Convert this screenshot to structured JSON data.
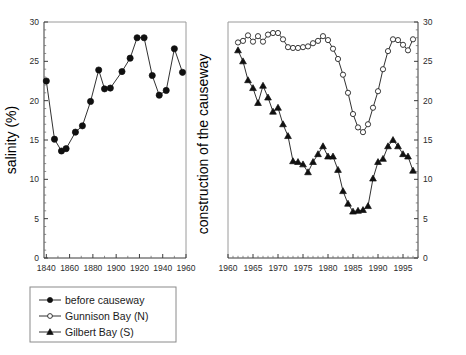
{
  "figure": {
    "title": "",
    "background_color": "#ffffff",
    "ink_color": "#1a1a1a"
  },
  "left_panel": {
    "ylabel": "salinity (%)",
    "xlim": [
      1838,
      1960
    ],
    "ylim": [
      0,
      30
    ],
    "yticks": [
      0,
      5,
      10,
      15,
      20,
      25,
      30
    ],
    "xticks": [
      1840,
      1860,
      1880,
      1900,
      1920,
      1940,
      1960
    ],
    "ytick_labels": [
      "0",
      "5",
      "10",
      "15",
      "20",
      "25",
      "30"
    ],
    "xtick_labels": [
      "1840",
      "1860",
      "1880",
      "1900",
      "1920",
      "1940",
      "1960"
    ]
  },
  "middle_annotation": {
    "text": "construction of the causeway"
  },
  "right_panel": {
    "xlim": [
      1960,
      1998
    ],
    "ylim": [
      0,
      30
    ],
    "yticks": [
      0,
      5,
      10,
      15,
      20,
      25,
      30
    ],
    "xticks": [
      1960,
      1965,
      1970,
      1975,
      1980,
      1985,
      1990,
      1995
    ],
    "ytick_labels": [
      "0",
      "5",
      "10",
      "15",
      "20",
      "25",
      "30"
    ],
    "xtick_labels": [
      "1960",
      "1965",
      "1970",
      "1975",
      "1980",
      "1985",
      "1990",
      "1995"
    ],
    "yaxis_side": "right"
  },
  "legend": {
    "position": "bottom-left",
    "items": [
      {
        "label": "before causeway",
        "marker": "filled-circle",
        "color": "#101010"
      },
      {
        "label": "Gunnison Bay (N)",
        "marker": "open-circle",
        "color": "#242424"
      },
      {
        "label": "Gilbert Bay (S)",
        "marker": "filled-triangle",
        "color": "#101010"
      }
    ]
  },
  "chart_data": {
    "type": "line",
    "xlabel": "",
    "ylabel": "salinity (%)",
    "grid": false,
    "legend_position": "bottom-left",
    "panels": [
      {
        "name": "before causeway",
        "xlim": [
          1838,
          1960
        ],
        "ylim": [
          0,
          30
        ],
        "series": [
          {
            "name": "before causeway",
            "marker": "filled-circle",
            "x": [
              1840,
              1847,
              1853,
              1857,
              1865,
              1871,
              1878,
              1885,
              1890,
              1895,
              1905,
              1912,
              1918,
              1924,
              1931,
              1937,
              1943,
              1950,
              1957
            ],
            "values": [
              22.5,
              15.1,
              13.6,
              13.9,
              16.0,
              16.8,
              19.9,
              23.9,
              21.5,
              21.6,
              23.7,
              25.4,
              28.0,
              28.0,
              23.2,
              20.7,
              21.3,
              26.6,
              23.6
            ]
          }
        ]
      },
      {
        "name": "after causeway",
        "xlim": [
          1960,
          1998
        ],
        "ylim": [
          0,
          30
        ],
        "series": [
          {
            "name": "Gunnison Bay (N)",
            "marker": "open-circle",
            "x": [
              1962,
              1963,
              1964,
              1965,
              1966,
              1967,
              1968,
              1969,
              1970,
              1971,
              1972,
              1973,
              1974,
              1975,
              1976,
              1977,
              1978,
              1979,
              1980,
              1981,
              1982,
              1983,
              1984,
              1985,
              1986,
              1987,
              1988,
              1989,
              1990,
              1991,
              1992,
              1993,
              1994,
              1995,
              1996,
              1997
            ],
            "values": [
              27.4,
              27.6,
              28.3,
              27.5,
              28.2,
              27.5,
              28.4,
              28.6,
              28.6,
              27.8,
              26.8,
              26.7,
              26.7,
              26.8,
              26.9,
              27.3,
              27.6,
              28.2,
              27.7,
              26.6,
              25.3,
              23.3,
              21.0,
              18.3,
              16.6,
              16.0,
              17.0,
              19.1,
              21.2,
              24.0,
              26.3,
              27.8,
              27.7,
              27.1,
              26.4,
              27.8
            ]
          },
          {
            "name": "Gilbert Bay (S)",
            "marker": "filled-triangle",
            "x": [
              1962,
              1963,
              1964,
              1965,
              1966,
              1967,
              1968,
              1969,
              1970,
              1971,
              1972,
              1973,
              1974,
              1975,
              1976,
              1977,
              1978,
              1979,
              1980,
              1981,
              1982,
              1983,
              1984,
              1985,
              1986,
              1987,
              1988,
              1989,
              1990,
              1991,
              1992,
              1993,
              1994,
              1995,
              1996,
              1997
            ],
            "values": [
              26.4,
              25.0,
              22.6,
              21.6,
              19.7,
              21.9,
              20.4,
              18.6,
              19.1,
              17.0,
              15.5,
              12.3,
              12.2,
              11.9,
              10.9,
              12.2,
              13.2,
              14.2,
              12.9,
              12.9,
              11.2,
              8.5,
              6.9,
              5.9,
              6.0,
              6.1,
              6.6,
              10.1,
              12.2,
              12.6,
              14.2,
              15.0,
              14.2,
              13.2,
              12.9,
              11.1
            ]
          }
        ]
      }
    ]
  }
}
